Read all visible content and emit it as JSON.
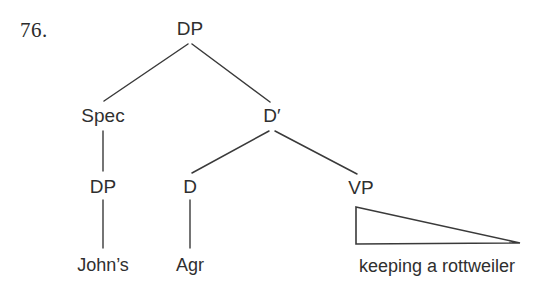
{
  "figure": {
    "example_number": "76.",
    "background_color": "#ffffff",
    "line_color": "#3a3a3a",
    "text_color": "#2f2f2f"
  },
  "tree": {
    "nodes": [
      {
        "id": "root-dp",
        "label": "DP",
        "x": 190,
        "y": 29,
        "type": "nonterminal"
      },
      {
        "id": "spec",
        "label": "Spec",
        "x": 103,
        "y": 116,
        "type": "nonterminal"
      },
      {
        "id": "dbar",
        "label": "D′",
        "x": 272,
        "y": 116,
        "type": "nonterminal"
      },
      {
        "id": "spec-dp",
        "label": "DP",
        "x": 103,
        "y": 187,
        "type": "nonterminal"
      },
      {
        "id": "d-head",
        "label": "D",
        "x": 190,
        "y": 187,
        "type": "nonterminal"
      },
      {
        "id": "vp",
        "label": "VP",
        "x": 361,
        "y": 188,
        "type": "nonterminal"
      }
    ],
    "terminals": [
      {
        "id": "johns",
        "label": "John’s",
        "x": 103,
        "y": 265
      },
      {
        "id": "agr",
        "label": "Agr",
        "x": 190,
        "y": 265
      },
      {
        "id": "vp-string",
        "label": "keeping a rottweiler",
        "x": 437,
        "y": 266
      }
    ],
    "branches": [
      {
        "id": "root-to-spec",
        "from": "root-dp",
        "to": "spec",
        "x1": 188,
        "y1": 44,
        "x2": 104,
        "y2": 101,
        "kind": "diagonal"
      },
      {
        "id": "root-to-dbar",
        "from": "root-dp",
        "to": "dbar",
        "x1": 192,
        "y1": 44,
        "x2": 270,
        "y2": 102,
        "kind": "diagonal"
      },
      {
        "id": "spec-to-dp",
        "from": "spec",
        "to": "spec-dp",
        "x1": 103,
        "y1": 131,
        "x2": 103,
        "y2": 171,
        "kind": "vertical"
      },
      {
        "id": "dbar-to-d",
        "from": "dbar",
        "to": "d-head",
        "x1": 269,
        "y1": 131,
        "x2": 192,
        "y2": 173,
        "kind": "diagonal"
      },
      {
        "id": "dbar-to-vp",
        "from": "dbar",
        "to": "vp",
        "x1": 275,
        "y1": 131,
        "x2": 357,
        "y2": 174,
        "kind": "diagonal"
      },
      {
        "id": "dp-to-johns",
        "from": "spec-dp",
        "to": "johns",
        "x1": 103,
        "y1": 200,
        "x2": 103,
        "y2": 248,
        "kind": "vertical"
      },
      {
        "id": "d-to-agr",
        "from": "d-head",
        "to": "agr",
        "x1": 190,
        "y1": 200,
        "x2": 190,
        "y2": 248,
        "kind": "vertical"
      }
    ],
    "triangle": {
      "id": "vp-triangle",
      "apex_x": 356,
      "apex_y": 207,
      "base_left_x": 356,
      "base_left_y": 244,
      "base_right_x": 520,
      "base_right_y": 243
    }
  }
}
